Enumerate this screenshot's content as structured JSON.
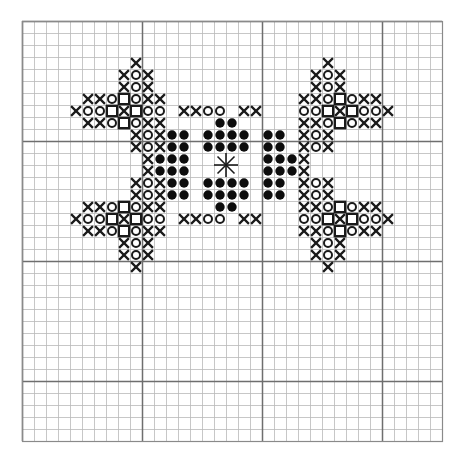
{
  "chart_data": {
    "type": "table",
    "xlabel": "",
    "ylabel": "",
    "grid": {
      "columns": 35,
      "rows": 35,
      "cell_size_px": 12,
      "origin_x_px": 22,
      "origin_y_px": 21,
      "minor_gridline_color": "#b9b9b9",
      "major_gridline_color": "#6e6e6e",
      "major_every": 10,
      "grid_on": true,
      "background": "#ffffff"
    },
    "legend_position": "none",
    "symbols": [
      {
        "key": "x",
        "name": "cross-stitch-x",
        "glyph": "X",
        "color": "#1a1a1a",
        "count": 128
      },
      {
        "key": "o",
        "name": "open-circle",
        "glyph": "O",
        "color": "#1a1a1a",
        "count": 60
      },
      {
        "key": "q",
        "name": "open-square",
        "glyph": "square",
        "color": "#1a1a1a",
        "count": 16
      },
      {
        "key": "f",
        "name": "filled-circle",
        "glyph": "filled-dot",
        "color": "#0d0d0d",
        "count": 56
      },
      {
        "key": "s",
        "name": "center-star",
        "glyph": "asterisk",
        "color": "#1a1a1a",
        "count": 1
      }
    ],
    "cells": [
      {
        "s": "x",
        "c": 9,
        "r": 3
      },
      {
        "s": "x",
        "c": 25,
        "r": 3
      },
      {
        "s": "x",
        "c": 8,
        "r": 4
      },
      {
        "s": "o",
        "c": 9,
        "r": 4
      },
      {
        "s": "x",
        "c": 10,
        "r": 4
      },
      {
        "s": "x",
        "c": 24,
        "r": 4
      },
      {
        "s": "o",
        "c": 25,
        "r": 4
      },
      {
        "s": "x",
        "c": 26,
        "r": 4
      },
      {
        "s": "x",
        "c": 8,
        "r": 5
      },
      {
        "s": "o",
        "c": 9,
        "r": 5
      },
      {
        "s": "x",
        "c": 10,
        "r": 5
      },
      {
        "s": "x",
        "c": 24,
        "r": 5
      },
      {
        "s": "o",
        "c": 25,
        "r": 5
      },
      {
        "s": "x",
        "c": 26,
        "r": 5
      },
      {
        "s": "x",
        "c": 5,
        "r": 6
      },
      {
        "s": "x",
        "c": 6,
        "r": 6
      },
      {
        "s": "o",
        "c": 7,
        "r": 6
      },
      {
        "s": "q",
        "c": 8,
        "r": 6
      },
      {
        "s": "o",
        "c": 9,
        "r": 6
      },
      {
        "s": "x",
        "c": 10,
        "r": 6
      },
      {
        "s": "x",
        "c": 11,
        "r": 6
      },
      {
        "s": "x",
        "c": 23,
        "r": 6
      },
      {
        "s": "x",
        "c": 24,
        "r": 6
      },
      {
        "s": "o",
        "c": 25,
        "r": 6
      },
      {
        "s": "q",
        "c": 26,
        "r": 6
      },
      {
        "s": "o",
        "c": 27,
        "r": 6
      },
      {
        "s": "x",
        "c": 28,
        "r": 6
      },
      {
        "s": "x",
        "c": 29,
        "r": 6
      },
      {
        "s": "x",
        "c": 4,
        "r": 7
      },
      {
        "s": "o",
        "c": 5,
        "r": 7
      },
      {
        "s": "o",
        "c": 6,
        "r": 7
      },
      {
        "s": "q",
        "c": 7,
        "r": 7
      },
      {
        "s": "x",
        "c": 8,
        "r": 7
      },
      {
        "s": "q",
        "c": 9,
        "r": 7
      },
      {
        "s": "o",
        "c": 10,
        "r": 7
      },
      {
        "s": "o",
        "c": 11,
        "r": 7
      },
      {
        "s": "x",
        "c": 13,
        "r": 7
      },
      {
        "s": "x",
        "c": 14,
        "r": 7
      },
      {
        "s": "o",
        "c": 15,
        "r": 7
      },
      {
        "s": "o",
        "c": 16,
        "r": 7
      },
      {
        "s": "x",
        "c": 18,
        "r": 7
      },
      {
        "s": "x",
        "c": 19,
        "r": 7
      },
      {
        "s": "o",
        "c": 23,
        "r": 7
      },
      {
        "s": "o",
        "c": 24,
        "r": 7
      },
      {
        "s": "q",
        "c": 25,
        "r": 7
      },
      {
        "s": "x",
        "c": 26,
        "r": 7
      },
      {
        "s": "q",
        "c": 27,
        "r": 7
      },
      {
        "s": "o",
        "c": 28,
        "r": 7
      },
      {
        "s": "o",
        "c": 29,
        "r": 7
      },
      {
        "s": "x",
        "c": 30,
        "r": 7
      },
      {
        "s": "x",
        "c": 5,
        "r": 8
      },
      {
        "s": "x",
        "c": 6,
        "r": 8
      },
      {
        "s": "o",
        "c": 7,
        "r": 8
      },
      {
        "s": "q",
        "c": 8,
        "r": 8
      },
      {
        "s": "o",
        "c": 9,
        "r": 8
      },
      {
        "s": "x",
        "c": 10,
        "r": 8
      },
      {
        "s": "x",
        "c": 11,
        "r": 8
      },
      {
        "s": "f",
        "c": 16,
        "r": 8
      },
      {
        "s": "f",
        "c": 17,
        "r": 8
      },
      {
        "s": "x",
        "c": 23,
        "r": 8
      },
      {
        "s": "x",
        "c": 24,
        "r": 8
      },
      {
        "s": "o",
        "c": 25,
        "r": 8
      },
      {
        "s": "q",
        "c": 26,
        "r": 8
      },
      {
        "s": "o",
        "c": 27,
        "r": 8
      },
      {
        "s": "x",
        "c": 28,
        "r": 8
      },
      {
        "s": "x",
        "c": 29,
        "r": 8
      },
      {
        "s": "x",
        "c": 9,
        "r": 9
      },
      {
        "s": "o",
        "c": 10,
        "r": 9
      },
      {
        "s": "x",
        "c": 11,
        "r": 9
      },
      {
        "s": "f",
        "c": 12,
        "r": 9
      },
      {
        "s": "f",
        "c": 13,
        "r": 9
      },
      {
        "s": "f",
        "c": 15,
        "r": 9
      },
      {
        "s": "f",
        "c": 16,
        "r": 9
      },
      {
        "s": "f",
        "c": 17,
        "r": 9
      },
      {
        "s": "f",
        "c": 18,
        "r": 9
      },
      {
        "s": "f",
        "c": 20,
        "r": 9
      },
      {
        "s": "f",
        "c": 21,
        "r": 9
      },
      {
        "s": "x",
        "c": 23,
        "r": 9
      },
      {
        "s": "o",
        "c": 24,
        "r": 9
      },
      {
        "s": "x",
        "c": 25,
        "r": 9
      },
      {
        "s": "x",
        "c": 9,
        "r": 10
      },
      {
        "s": "o",
        "c": 10,
        "r": 10
      },
      {
        "s": "x",
        "c": 11,
        "r": 10
      },
      {
        "s": "f",
        "c": 12,
        "r": 10
      },
      {
        "s": "f",
        "c": 13,
        "r": 10
      },
      {
        "s": "f",
        "c": 15,
        "r": 10
      },
      {
        "s": "f",
        "c": 16,
        "r": 10
      },
      {
        "s": "f",
        "c": 17,
        "r": 10
      },
      {
        "s": "f",
        "c": 18,
        "r": 10
      },
      {
        "s": "f",
        "c": 20,
        "r": 10
      },
      {
        "s": "f",
        "c": 21,
        "r": 10
      },
      {
        "s": "x",
        "c": 23,
        "r": 10
      },
      {
        "s": "o",
        "c": 24,
        "r": 10
      },
      {
        "s": "x",
        "c": 25,
        "r": 10
      },
      {
        "s": "x",
        "c": 10,
        "r": 11
      },
      {
        "s": "f",
        "c": 11,
        "r": 11
      },
      {
        "s": "f",
        "c": 12,
        "r": 11
      },
      {
        "s": "f",
        "c": 13,
        "r": 11
      },
      {
        "s": "s",
        "c": 16,
        "r": 11
      },
      {
        "s": "f",
        "c": 20,
        "r": 11
      },
      {
        "s": "f",
        "c": 21,
        "r": 11
      },
      {
        "s": "f",
        "c": 22,
        "r": 11
      },
      {
        "s": "x",
        "c": 23,
        "r": 11
      },
      {
        "s": "x",
        "c": 10,
        "r": 12
      },
      {
        "s": "f",
        "c": 11,
        "r": 12
      },
      {
        "s": "f",
        "c": 12,
        "r": 12
      },
      {
        "s": "f",
        "c": 13,
        "r": 12
      },
      {
        "s": "f",
        "c": 20,
        "r": 12
      },
      {
        "s": "f",
        "c": 21,
        "r": 12
      },
      {
        "s": "f",
        "c": 22,
        "r": 12
      },
      {
        "s": "x",
        "c": 23,
        "r": 12
      },
      {
        "s": "x",
        "c": 9,
        "r": 13
      },
      {
        "s": "o",
        "c": 10,
        "r": 13
      },
      {
        "s": "x",
        "c": 11,
        "r": 13
      },
      {
        "s": "f",
        "c": 12,
        "r": 13
      },
      {
        "s": "f",
        "c": 13,
        "r": 13
      },
      {
        "s": "f",
        "c": 15,
        "r": 13
      },
      {
        "s": "f",
        "c": 16,
        "r": 13
      },
      {
        "s": "f",
        "c": 17,
        "r": 13
      },
      {
        "s": "f",
        "c": 18,
        "r": 13
      },
      {
        "s": "f",
        "c": 20,
        "r": 13
      },
      {
        "s": "f",
        "c": 21,
        "r": 13
      },
      {
        "s": "x",
        "c": 23,
        "r": 13
      },
      {
        "s": "o",
        "c": 24,
        "r": 13
      },
      {
        "s": "x",
        "c": 25,
        "r": 13
      },
      {
        "s": "x",
        "c": 9,
        "r": 14
      },
      {
        "s": "o",
        "c": 10,
        "r": 14
      },
      {
        "s": "x",
        "c": 11,
        "r": 14
      },
      {
        "s": "f",
        "c": 12,
        "r": 14
      },
      {
        "s": "f",
        "c": 13,
        "r": 14
      },
      {
        "s": "f",
        "c": 15,
        "r": 14
      },
      {
        "s": "f",
        "c": 16,
        "r": 14
      },
      {
        "s": "f",
        "c": 17,
        "r": 14
      },
      {
        "s": "f",
        "c": 18,
        "r": 14
      },
      {
        "s": "f",
        "c": 20,
        "r": 14
      },
      {
        "s": "f",
        "c": 21,
        "r": 14
      },
      {
        "s": "x",
        "c": 23,
        "r": 14
      },
      {
        "s": "o",
        "c": 24,
        "r": 14
      },
      {
        "s": "x",
        "c": 25,
        "r": 14
      },
      {
        "s": "x",
        "c": 5,
        "r": 15
      },
      {
        "s": "x",
        "c": 6,
        "r": 15
      },
      {
        "s": "o",
        "c": 7,
        "r": 15
      },
      {
        "s": "q",
        "c": 8,
        "r": 15
      },
      {
        "s": "o",
        "c": 9,
        "r": 15
      },
      {
        "s": "x",
        "c": 10,
        "r": 15
      },
      {
        "s": "x",
        "c": 11,
        "r": 15
      },
      {
        "s": "f",
        "c": 16,
        "r": 15
      },
      {
        "s": "f",
        "c": 17,
        "r": 15
      },
      {
        "s": "x",
        "c": 23,
        "r": 15
      },
      {
        "s": "x",
        "c": 24,
        "r": 15
      },
      {
        "s": "o",
        "c": 25,
        "r": 15
      },
      {
        "s": "q",
        "c": 26,
        "r": 15
      },
      {
        "s": "o",
        "c": 27,
        "r": 15
      },
      {
        "s": "x",
        "c": 28,
        "r": 15
      },
      {
        "s": "x",
        "c": 29,
        "r": 15
      },
      {
        "s": "x",
        "c": 4,
        "r": 16
      },
      {
        "s": "o",
        "c": 5,
        "r": 16
      },
      {
        "s": "o",
        "c": 6,
        "r": 16
      },
      {
        "s": "q",
        "c": 7,
        "r": 16
      },
      {
        "s": "x",
        "c": 8,
        "r": 16
      },
      {
        "s": "q",
        "c": 9,
        "r": 16
      },
      {
        "s": "o",
        "c": 10,
        "r": 16
      },
      {
        "s": "o",
        "c": 11,
        "r": 16
      },
      {
        "s": "x",
        "c": 13,
        "r": 16
      },
      {
        "s": "x",
        "c": 14,
        "r": 16
      },
      {
        "s": "o",
        "c": 15,
        "r": 16
      },
      {
        "s": "o",
        "c": 16,
        "r": 16
      },
      {
        "s": "x",
        "c": 18,
        "r": 16
      },
      {
        "s": "x",
        "c": 19,
        "r": 16
      },
      {
        "s": "o",
        "c": 23,
        "r": 16
      },
      {
        "s": "o",
        "c": 24,
        "r": 16
      },
      {
        "s": "q",
        "c": 25,
        "r": 16
      },
      {
        "s": "x",
        "c": 26,
        "r": 16
      },
      {
        "s": "q",
        "c": 27,
        "r": 16
      },
      {
        "s": "o",
        "c": 28,
        "r": 16
      },
      {
        "s": "o",
        "c": 29,
        "r": 16
      },
      {
        "s": "x",
        "c": 30,
        "r": 16
      },
      {
        "s": "x",
        "c": 5,
        "r": 17
      },
      {
        "s": "x",
        "c": 6,
        "r": 17
      },
      {
        "s": "o",
        "c": 7,
        "r": 17
      },
      {
        "s": "q",
        "c": 8,
        "r": 17
      },
      {
        "s": "o",
        "c": 9,
        "r": 17
      },
      {
        "s": "x",
        "c": 10,
        "r": 17
      },
      {
        "s": "x",
        "c": 11,
        "r": 17
      },
      {
        "s": "x",
        "c": 23,
        "r": 17
      },
      {
        "s": "x",
        "c": 24,
        "r": 17
      },
      {
        "s": "o",
        "c": 25,
        "r": 17
      },
      {
        "s": "q",
        "c": 26,
        "r": 17
      },
      {
        "s": "o",
        "c": 27,
        "r": 17
      },
      {
        "s": "x",
        "c": 28,
        "r": 17
      },
      {
        "s": "x",
        "c": 29,
        "r": 17
      },
      {
        "s": "x",
        "c": 8,
        "r": 18
      },
      {
        "s": "o",
        "c": 9,
        "r": 18
      },
      {
        "s": "x",
        "c": 10,
        "r": 18
      },
      {
        "s": "x",
        "c": 24,
        "r": 18
      },
      {
        "s": "o",
        "c": 25,
        "r": 18
      },
      {
        "s": "x",
        "c": 26,
        "r": 18
      },
      {
        "s": "x",
        "c": 8,
        "r": 19
      },
      {
        "s": "o",
        "c": 9,
        "r": 19
      },
      {
        "s": "x",
        "c": 10,
        "r": 19
      },
      {
        "s": "x",
        "c": 24,
        "r": 19
      },
      {
        "s": "o",
        "c": 25,
        "r": 19
      },
      {
        "s": "x",
        "c": 26,
        "r": 19
      },
      {
        "s": "x",
        "c": 9,
        "r": 20
      },
      {
        "s": "x",
        "c": 25,
        "r": 20
      }
    ]
  }
}
